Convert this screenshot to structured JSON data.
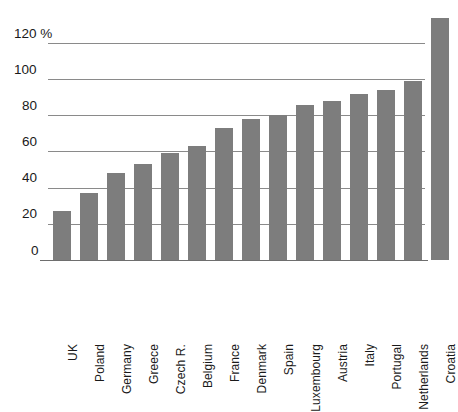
{
  "chart_data": {
    "type": "bar",
    "title": "",
    "subtitle": "",
    "xlabel": "",
    "ylabel": "",
    "unit_label": "%",
    "ylim": [
      0,
      140
    ],
    "grid": true,
    "legend": "none",
    "orientation": "vertical",
    "bar_color": "#7d7d7d",
    "gridline_color": "#8a8a8a",
    "background_color": "#ffffff",
    "yticks": [
      0,
      20,
      40,
      60,
      80,
      100,
      120
    ],
    "ytick_labels": [
      "0",
      "20",
      "40",
      "60",
      "80",
      "100",
      "120 %"
    ],
    "categories": [
      "UK",
      "Poland",
      "Germany",
      "Greece",
      "Czech R.",
      "Belgium",
      "France",
      "Denmark",
      "Spain",
      "Luxembourg",
      "Austria",
      "Italy",
      "Portugal",
      "Netherlands",
      "Croatia"
    ],
    "values": [
      27,
      37,
      48,
      53,
      59,
      63,
      73,
      78,
      80,
      86,
      88,
      92,
      94,
      99,
      134
    ]
  }
}
